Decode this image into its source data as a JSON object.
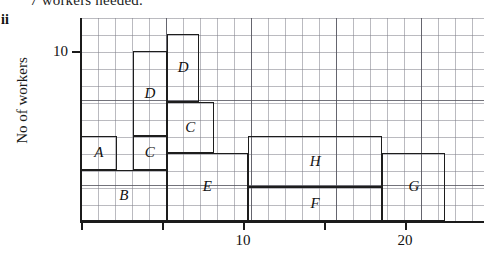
{
  "header": {
    "cut_off_text": "7 workers needed.",
    "part_label": "ii"
  },
  "axes": {
    "y_title": "No of workers",
    "y_ticks": [
      {
        "label": "10",
        "value": 10
      }
    ],
    "x_ticks": [
      {
        "label": "",
        "value": 0
      },
      {
        "label": "",
        "value": 5
      },
      {
        "label": "10",
        "value": 10
      },
      {
        "label": "",
        "value": 15
      },
      {
        "label": "20",
        "value": 20
      }
    ]
  },
  "chart_data": {
    "type": "bar",
    "title": "",
    "xlabel": "",
    "ylabel": "No of workers",
    "xlim": [
      0,
      24.9
    ],
    "ylim": [
      0,
      12
    ],
    "grid": true,
    "legend": "none",
    "note": "Overlapping/stacked box diagram of task bars A-H drawn over a squared grid. x is time, y is number of workers.",
    "categories": [
      "A",
      "B",
      "C",
      "D",
      "C",
      "D",
      "E",
      "H",
      "F",
      "G"
    ],
    "bars": [
      {
        "label": "A",
        "x_start": 0.0,
        "x_end": 2.2,
        "y_bottom": 3.0,
        "y_top": 5.0
      },
      {
        "label": "B",
        "x_start": 0.0,
        "x_end": 5.3,
        "y_bottom": 0.0,
        "y_top": 3.0
      },
      {
        "label": "C",
        "x_start": 3.2,
        "x_end": 5.3,
        "y_bottom": 3.0,
        "y_top": 5.0
      },
      {
        "label": "D",
        "x_start": 3.2,
        "x_end": 5.3,
        "y_bottom": 5.0,
        "y_top": 10.0
      },
      {
        "label": "C",
        "x_start": 5.3,
        "x_end": 8.2,
        "y_bottom": 4.0,
        "y_top": 7.0
      },
      {
        "label": "D",
        "x_start": 5.3,
        "x_end": 7.3,
        "y_bottom": 7.0,
        "y_top": 11.0
      },
      {
        "label": "E",
        "x_start": 5.3,
        "x_end": 10.3,
        "y_bottom": 0.0,
        "y_top": 4.0
      },
      {
        "label": "H",
        "x_start": 10.3,
        "x_end": 18.6,
        "y_bottom": 2.0,
        "y_top": 5.0
      },
      {
        "label": "F",
        "x_start": 10.3,
        "x_end": 18.6,
        "y_bottom": 0.0,
        "y_top": 2.0
      },
      {
        "label": "G",
        "x_start": 18.6,
        "x_end": 22.5,
        "y_bottom": 0.0,
        "y_top": 4.0
      }
    ]
  }
}
